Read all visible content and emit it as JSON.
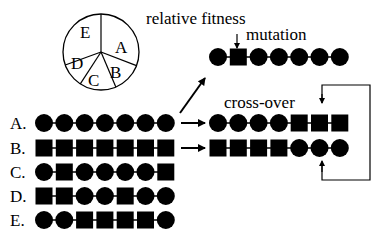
{
  "title_labels": {
    "relative_fitness": "relative fitness",
    "mutation": "mutation",
    "crossover": "cross-over"
  },
  "pie": {
    "center": [
      101,
      52
    ],
    "radius": 38,
    "slices": [
      {
        "label": "A",
        "start_deg": 0,
        "end_deg": 111
      },
      {
        "label": "B",
        "start_deg": 111,
        "end_deg": 157
      },
      {
        "label": "C",
        "start_deg": 157,
        "end_deg": 213
      },
      {
        "label": "D",
        "start_deg": 213,
        "end_deg": 250
      },
      {
        "label": "E",
        "start_deg": 250,
        "end_deg": 360
      }
    ]
  },
  "population": [
    {
      "label": "A.",
      "genes": [
        "c",
        "c",
        "c",
        "c",
        "c",
        "c",
        "c"
      ]
    },
    {
      "label": "B.",
      "genes": [
        "s",
        "s",
        "s",
        "s",
        "s",
        "s",
        "s"
      ]
    },
    {
      "label": "C.",
      "genes": [
        "c",
        "s",
        "c",
        "c",
        "c",
        "c",
        "s"
      ]
    },
    {
      "label": "D.",
      "genes": [
        "s",
        "s",
        "c",
        "c",
        "s",
        "c",
        "c"
      ]
    },
    {
      "label": "E.",
      "genes": [
        "c",
        "c",
        "s",
        "s",
        "s",
        "s",
        "c"
      ]
    }
  ],
  "mutation_result": {
    "genes": [
      "c",
      "s",
      "c",
      "c",
      "c",
      "c",
      "c"
    ],
    "marked_index": 1
  },
  "crossover_results": [
    {
      "genes": [
        "c",
        "c",
        "c",
        "c",
        "s",
        "s",
        "s"
      ]
    },
    {
      "genes": [
        "s",
        "s",
        "s",
        "s",
        "c",
        "c",
        "c"
      ]
    }
  ],
  "colors": {
    "ink": "#000000",
    "background": "#ffffff"
  }
}
